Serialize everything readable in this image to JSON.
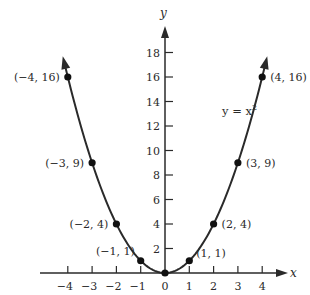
{
  "chart_data": {
    "type": "line",
    "title": "",
    "function": "y = x^2",
    "equation_label": "y = x",
    "equation_exponent": "2",
    "xlabel": "x",
    "ylabel": "y",
    "xlim": [
      -4.5,
      4.7
    ],
    "ylim": [
      0,
      19.5
    ],
    "grid": false,
    "x_ticks": [
      -4,
      -3,
      -2,
      -1,
      0,
      1,
      2,
      3,
      4
    ],
    "x_tick_labels": [
      "−4",
      "−3",
      "−2",
      "−1",
      "0",
      "1",
      "2",
      "3",
      "4"
    ],
    "y_ticks": [
      2,
      4,
      6,
      8,
      10,
      12,
      14,
      16,
      18
    ],
    "y_tick_labels": [
      "2",
      "4",
      "6",
      "8",
      "10",
      "12",
      "14",
      "16",
      "18"
    ],
    "series": [
      {
        "name": "y = x^2",
        "x": [
          -4,
          -3,
          -2,
          -1,
          0,
          1,
          2,
          3,
          4
        ],
        "y": [
          16,
          9,
          4,
          1,
          0,
          1,
          4,
          9,
          16
        ]
      }
    ],
    "points": [
      {
        "x": -4,
        "y": 16,
        "label": "(−4, 16)",
        "side": "left"
      },
      {
        "x": -3,
        "y": 9,
        "label": "(−3, 9)",
        "side": "left"
      },
      {
        "x": -2,
        "y": 4,
        "label": "(−2, 4)",
        "side": "left"
      },
      {
        "x": -1,
        "y": 1,
        "label": "(−1, 1)",
        "side": "left-up"
      },
      {
        "x": 0,
        "y": 0,
        "label": "",
        "side": "none"
      },
      {
        "x": 1,
        "y": 1,
        "label": "(1, 1)",
        "side": "right-up"
      },
      {
        "x": 2,
        "y": 4,
        "label": "(2, 4)",
        "side": "right"
      },
      {
        "x": 3,
        "y": 9,
        "label": "(3, 9)",
        "side": "right"
      },
      {
        "x": 4,
        "y": 16,
        "label": "(4, 16)",
        "side": "right"
      }
    ],
    "curve_extends_to_y": 17.7,
    "colors": {
      "curve": "#2a2a2a",
      "axes": "#2a2a2a",
      "points": "#111111",
      "background": "#ffffff"
    }
  }
}
